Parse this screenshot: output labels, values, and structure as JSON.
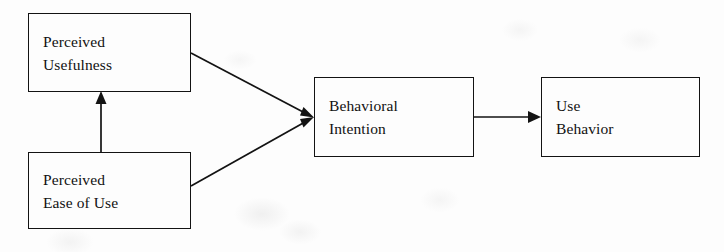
{
  "diagram": {
    "background_color": "#fdfdfd",
    "stroke_color": "#131313",
    "text_color": "#111111",
    "nodes": [
      {
        "id": "perceived-usefulness",
        "line1": "Perceived",
        "line2": "Usefulness",
        "x": 28,
        "y": 13,
        "width": 163,
        "height": 79
      },
      {
        "id": "perceived-ease-of-use",
        "line1": "Perceived",
        "line2": "Ease of Use",
        "x": 28,
        "y": 152,
        "width": 163,
        "height": 77
      },
      {
        "id": "behavioral-intention",
        "line1": "Behavioral",
        "line2": "Intention",
        "x": 314,
        "y": 77,
        "width": 160,
        "height": 80
      },
      {
        "id": "use-behavior",
        "line1": "Use",
        "line2": "Behavior",
        "x": 541,
        "y": 77,
        "width": 159,
        "height": 80
      }
    ],
    "edges": [
      {
        "id": "ease-to-usefulness",
        "from": "perceived-ease-of-use",
        "to": "perceived-usefulness",
        "style": "vertical-arrow"
      },
      {
        "id": "usefulness-to-intention",
        "from": "perceived-usefulness",
        "to": "behavioral-intention",
        "style": "diagonal-arrow-down"
      },
      {
        "id": "ease-to-intention",
        "from": "perceived-ease-of-use",
        "to": "behavioral-intention",
        "style": "diagonal-arrow-up"
      },
      {
        "id": "intention-to-behavior",
        "from": "behavioral-intention",
        "to": "use-behavior",
        "style": "horizontal-arrow"
      }
    ]
  }
}
